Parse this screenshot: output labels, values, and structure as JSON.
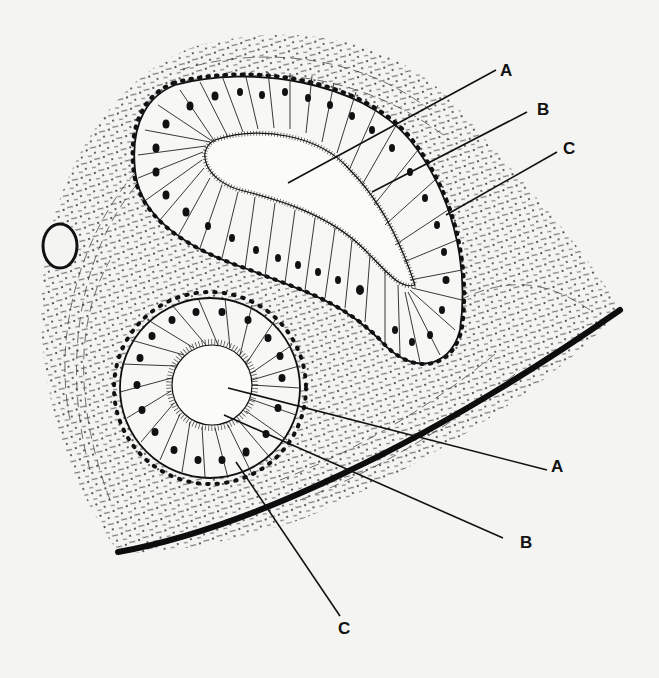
{
  "diagram": {
    "background_color": "#f4f4f2",
    "ink_color": "#111111",
    "structures": [
      {
        "id": "upper-gland",
        "shape": "curved elongated tubule",
        "lumen": "irregular slit"
      },
      {
        "id": "lower-gland",
        "shape": "round tubule",
        "lumen": "circular"
      },
      {
        "id": "small-vessel",
        "shape": "small oval at left edge"
      },
      {
        "id": "surface-edge",
        "shape": "thick dark curved border at lower right"
      }
    ],
    "labels": [
      {
        "text": "A",
        "x": 500,
        "y": 62,
        "pointer_from": [
          496,
          70
        ],
        "pointer_to": [
          288,
          183
        ],
        "target": "upper-gland-lumen"
      },
      {
        "text": "B",
        "x": 537,
        "y": 101,
        "pointer_from": [
          527,
          112
        ],
        "pointer_to": [
          372,
          192
        ],
        "target": "upper-gland-luminal-border"
      },
      {
        "text": "C",
        "x": 563,
        "y": 140,
        "pointer_from": [
          557,
          152
        ],
        "pointer_to": [
          446,
          215
        ],
        "target": "upper-gland-epithelial-cells"
      },
      {
        "text": "A",
        "x": 551,
        "y": 458,
        "pointer_from": [
          547,
          470
        ],
        "pointer_to": [
          228,
          388
        ],
        "target": "lower-gland-lumen"
      },
      {
        "text": "B",
        "x": 520,
        "y": 534,
        "pointer_from": [
          503,
          538
        ],
        "pointer_to": [
          224,
          415
        ],
        "target": "lower-gland-luminal-border"
      },
      {
        "text": "C",
        "x": 338,
        "y": 620,
        "pointer_from": [
          340,
          616
        ],
        "pointer_to": [
          236,
          462
        ],
        "target": "lower-gland-epithelial-cells"
      }
    ]
  }
}
